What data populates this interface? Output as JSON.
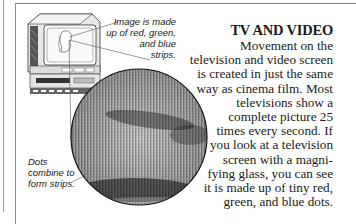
{
  "article": {
    "title": "TV AND VIDEO",
    "body_lines": [
      "Movement on the",
      "television and video screen",
      "is created in just the same",
      "way as cinema film. Most",
      "televisions show a",
      "complete picture 25",
      "times every second. If",
      "you look at a television",
      "screen with a magni-",
      "fying glass, you can see",
      "it is made up of tiny red,",
      "green, and blue dots."
    ]
  },
  "illustration": {
    "subject": "television-set",
    "magnified_view": "magnifying-circle",
    "captions": {
      "top": [
        "Image is made",
        "up of red, green,",
        "and blue",
        "strips."
      ],
      "bottom": [
        "Dots",
        "combine to",
        "form strips."
      ]
    }
  },
  "colors": {
    "text": "#1a1a1a",
    "border": "#8a8a8a",
    "screen_dots": "#9a9a9a"
  }
}
